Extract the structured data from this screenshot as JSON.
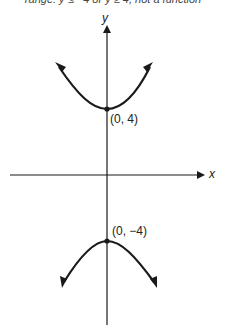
{
  "caption": "range: y ≤ −4 or y ≥ 4, not a function",
  "axes": {
    "x_label": "x",
    "y_label": "y"
  },
  "points": [
    {
      "label": "(0, 4)",
      "x": 0,
      "y": 4
    },
    {
      "label": "(0, −4)",
      "x": 0,
      "y": -4
    }
  ],
  "colors": {
    "stroke": "#1a1a1a",
    "background": "#ffffff"
  }
}
